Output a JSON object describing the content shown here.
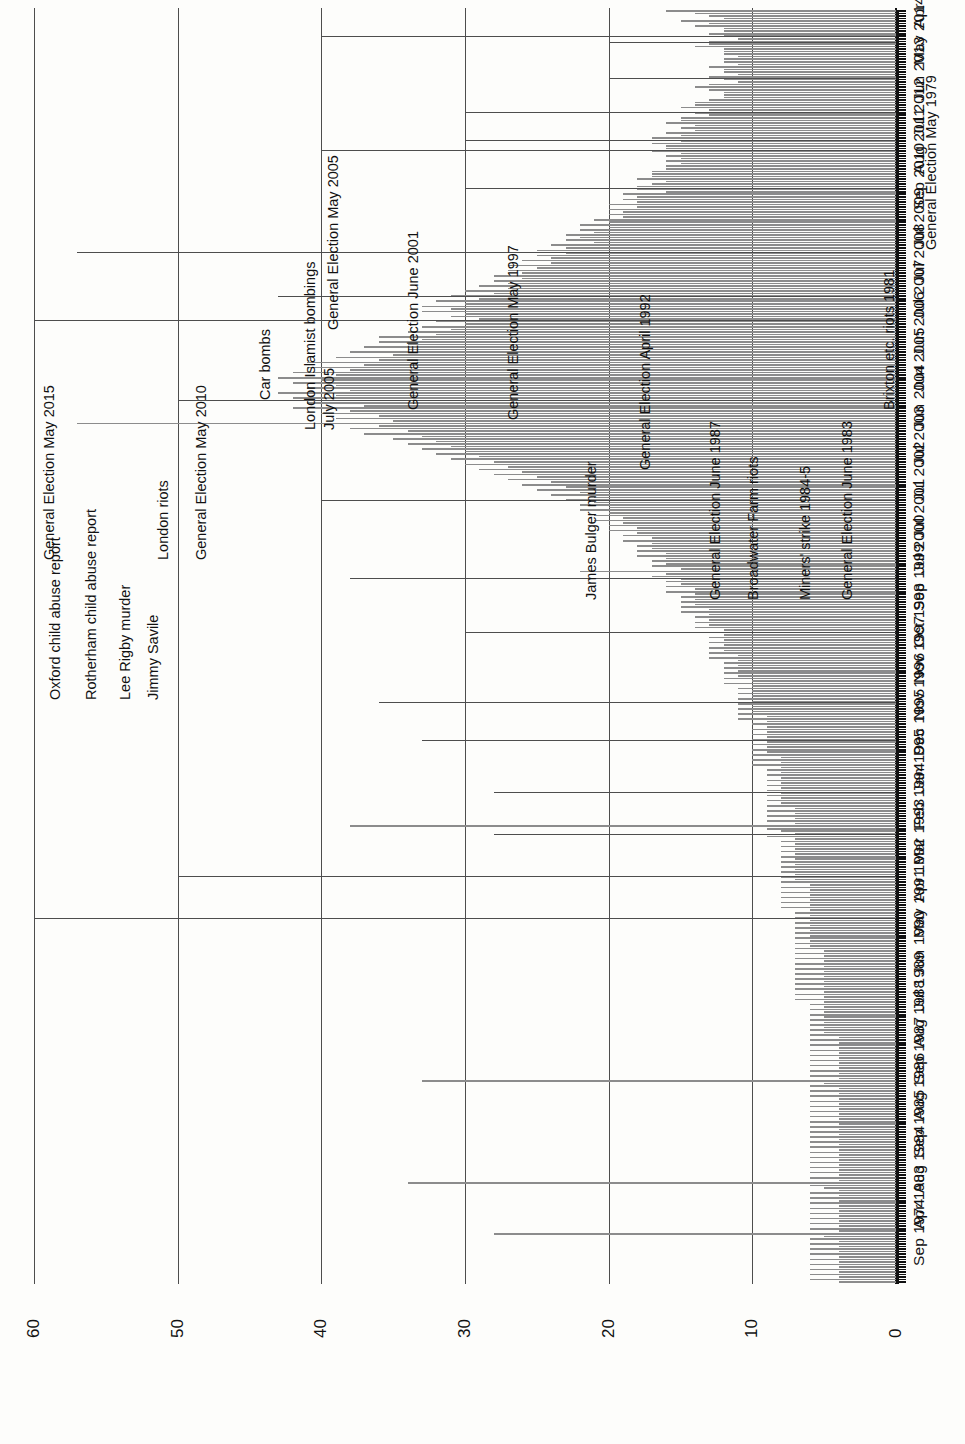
{
  "chart_data": {
    "type": "bar",
    "orientation": "rotated-horizontal",
    "title": "",
    "subtitle": "",
    "xlabel": "",
    "ylabel": "",
    "ylim": [
      0,
      60
    ],
    "value_ticks": [
      0,
      10,
      20,
      30,
      40,
      50,
      60
    ],
    "grid": true,
    "legend": null,
    "bar_color": "#8c8c8c",
    "axis_color": "#111111",
    "gridline_color": "#4d4d4d",
    "category_tick_labels": [
      "Apr 2015",
      "May 2014",
      "Jun 2013",
      "Jul 2012",
      "Aug 2011",
      "Sep 2010",
      "Jul 2009",
      "Jul 2008",
      "Jul 2007",
      "Jun 2006",
      "Jun 2005",
      "Jun 2004",
      "Jul 2003",
      "Jul 2002",
      "Jul 2001",
      "Jul 2000",
      "Sep 1999",
      "Oct 1998",
      "Nov 1997",
      "Nov 1996",
      "Dec 1995",
      "Jan 1995",
      "Feb 1994",
      "Mar 1993",
      "Apr 1992",
      "May 1991",
      "Jun 1990",
      "Jul 1989",
      "Aug 1988",
      "Sep 1987",
      "Aug 1986",
      "Sep 1985",
      "Aug 1984",
      "Apr 1983",
      "Sep 1974"
    ],
    "note": "Monthly series read newest-first (Apr 2015) at top to oldest (Sep 1974) at bottom.",
    "values": [
      16,
      14,
      13,
      12,
      15,
      13,
      14,
      12,
      12,
      13,
      12,
      11,
      13,
      13,
      14,
      12,
      12,
      12,
      11,
      12,
      12,
      11,
      13,
      12,
      12,
      11,
      13,
      12,
      11,
      13,
      14,
      13,
      12,
      12,
      12,
      13,
      14,
      14,
      15,
      13,
      14,
      13,
      15,
      15,
      16,
      14,
      15,
      14,
      16,
      15,
      17,
      15,
      17,
      16,
      16,
      17,
      15,
      16,
      15,
      16,
      15,
      16,
      16,
      17,
      17,
      17,
      18,
      16,
      17,
      18,
      18,
      16,
      19,
      18,
      19,
      18,
      20,
      18,
      20,
      19,
      20,
      19,
      21,
      20,
      22,
      20,
      22,
      21,
      23,
      22,
      23,
      21,
      24,
      23,
      25,
      23,
      25,
      24,
      26,
      24,
      27,
      25,
      27,
      26,
      28,
      26,
      28,
      27,
      29,
      27,
      30,
      28,
      31,
      29,
      32,
      30,
      33,
      31,
      33,
      30,
      31,
      29,
      32,
      30,
      33,
      31,
      34,
      32,
      36,
      33,
      36,
      34,
      37,
      34,
      38,
      35,
      39,
      36,
      41,
      37,
      41,
      38,
      42,
      39,
      43,
      40,
      42,
      39,
      41,
      38,
      43,
      39,
      42,
      38,
      41,
      37,
      42,
      38,
      40,
      36,
      39,
      35,
      57,
      36,
      38,
      34,
      37,
      33,
      35,
      32,
      34,
      31,
      33,
      30,
      32,
      29,
      31,
      28,
      30,
      27,
      29,
      26,
      28,
      25,
      27,
      24,
      26,
      23,
      25,
      22,
      24,
      21,
      23,
      21,
      22,
      20,
      22,
      20,
      21,
      19,
      21,
      19,
      20,
      18,
      20,
      18,
      19,
      17,
      19,
      17,
      18,
      17,
      18,
      16,
      18,
      16,
      17,
      16,
      17,
      15,
      22,
      16,
      17,
      15,
      16,
      15,
      16,
      14,
      16,
      14,
      15,
      14,
      15,
      14,
      15,
      13,
      15,
      13,
      14,
      13,
      14,
      13,
      14,
      12,
      14,
      12,
      13,
      12,
      13,
      12,
      13,
      12,
      13,
      11,
      13,
      11,
      12,
      11,
      12,
      11,
      12,
      11,
      12,
      10,
      12,
      10,
      11,
      10,
      11,
      10,
      11,
      10,
      11,
      10,
      11,
      10,
      11,
      9,
      11,
      9,
      10,
      9,
      10,
      9,
      10,
      9,
      10,
      9,
      10,
      9,
      10,
      9,
      10,
      8,
      10,
      8,
      10,
      8,
      9,
      8,
      9,
      8,
      9,
      8,
      9,
      8,
      9,
      8,
      9,
      8,
      9,
      8,
      9,
      7,
      9,
      7,
      9,
      7,
      9,
      7,
      38,
      9,
      8,
      7,
      9,
      7,
      8,
      7,
      8,
      7,
      8,
      7,
      8,
      7,
      8,
      7,
      8,
      7,
      8,
      7,
      8,
      7,
      8,
      6,
      8,
      6,
      8,
      6,
      8,
      6,
      8,
      6,
      8,
      6,
      7,
      6,
      7,
      6,
      7,
      6,
      7,
      6,
      7,
      6,
      7,
      6,
      7,
      6,
      7,
      5,
      7,
      5,
      7,
      5,
      7,
      5,
      7,
      5,
      7,
      5,
      7,
      5,
      7,
      5,
      7,
      5,
      7,
      5,
      7,
      5,
      6,
      5,
      6,
      5,
      6,
      5,
      6,
      5,
      6,
      5,
      6,
      5,
      6,
      4,
      6,
      4,
      6,
      4,
      6,
      4,
      6,
      4,
      6,
      4,
      6,
      4,
      6,
      4,
      6,
      4,
      33,
      5,
      6,
      4,
      6,
      4,
      6,
      4,
      6,
      4,
      6,
      4,
      6,
      4,
      6,
      4,
      6,
      4,
      6,
      4,
      6,
      4,
      6,
      4,
      6,
      4,
      6,
      4,
      6,
      4,
      6,
      4,
      6,
      4,
      6,
      4,
      6,
      4,
      6,
      4,
      34,
      6,
      5,
      4,
      6,
      4,
      6,
      4,
      6,
      4,
      6,
      4,
      6,
      4,
      6,
      4,
      6,
      4,
      6,
      4,
      28,
      5,
      6,
      4,
      6,
      4,
      6,
      4,
      6,
      4,
      6,
      4,
      6,
      4,
      6,
      4,
      6,
      4,
      6,
      4
    ],
    "annotations": [
      {
        "label": "Oxford child abuse report",
        "value": 20,
        "lines": 1
      },
      {
        "label": "Rotherham child abuse report",
        "value": 20,
        "lines": 1
      },
      {
        "label": "Lee Rigby murder",
        "value": 30,
        "lines": 1
      },
      {
        "label": "Jimmy Savile",
        "value": 30,
        "lines": 1
      },
      {
        "label": "General Election May 2015",
        "value": 40,
        "lines": 1
      },
      {
        "label": "London riots",
        "value": 40,
        "lines": 1
      },
      {
        "label": "General Election May 2010",
        "value": 30,
        "lines": 1
      },
      {
        "label": "Car bombs",
        "value": 57,
        "lines": 1
      },
      {
        "label": "London Islamist bombings\nJuly 2005",
        "value": 43,
        "lines": 2
      },
      {
        "label": "General Election May 2005",
        "value": 60,
        "lines": 1
      },
      {
        "label": "General Election June 2001",
        "value": 50,
        "lines": 1
      },
      {
        "label": "General Election May 1997",
        "value": 40,
        "lines": 1
      },
      {
        "label": "James Bulger murder",
        "value": 38,
        "lines": 1
      },
      {
        "label": "General Election April 1992",
        "value": 30,
        "lines": 1
      },
      {
        "label": "General Election June 1987",
        "value": 36,
        "lines": 1
      },
      {
        "label": "Broadwater Farm riots",
        "value": 33,
        "lines": 1
      },
      {
        "label": "Miners' strike 1984-5",
        "value": 28,
        "lines": 1
      },
      {
        "label": "General Election June 1983",
        "value": 28,
        "lines": 1
      },
      {
        "label": "Brixton etc. riots 1981",
        "value": 50,
        "lines": 1
      },
      {
        "label": "General Election May 1979",
        "value": 60,
        "lines": 1
      }
    ]
  }
}
